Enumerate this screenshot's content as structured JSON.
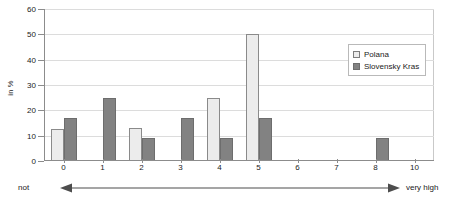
{
  "chart_data": {
    "type": "bar",
    "title": "",
    "subtitle": "",
    "xlabel": "",
    "ylabel": "in %",
    "categories": [
      "0",
      "1",
      "2",
      "3",
      "4",
      "5",
      "6",
      "7",
      "8",
      "10"
    ],
    "series": [
      {
        "name": "Polana",
        "color": "#ececec",
        "values": [
          12.5,
          0,
          13,
          0,
          25,
          50,
          0,
          0,
          0,
          0
        ]
      },
      {
        "name": "Slovensky Kras",
        "color": "#828282",
        "values": [
          17,
          25,
          9,
          17,
          9,
          17,
          0,
          0,
          9,
          0
        ]
      }
    ],
    "ylim": [
      0,
      60
    ],
    "yticks": [
      0,
      10,
      20,
      30,
      40,
      50,
      60
    ],
    "ytick_labels": [
      "0",
      "10",
      "20",
      "30",
      "40",
      "50",
      "60"
    ],
    "grid": true,
    "grid_axis": "y",
    "legend_position": "top-right",
    "annotations": {
      "scale_low_label": "not",
      "scale_high_label": "very high",
      "scale_arrow": "double-headed-arrow"
    }
  },
  "colors": {
    "series_polana": "#ececec",
    "series_kras": "#828282",
    "grid": "#dcdcdc",
    "axis": "#8c8c8c",
    "text": "#1a1a1a",
    "background": "#ffffff"
  }
}
